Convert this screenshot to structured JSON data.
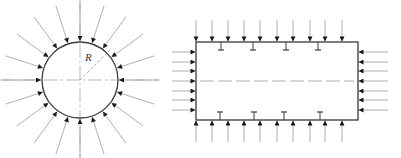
{
  "diagram": {
    "colors": {
      "outline": "#3a3a3a",
      "arrow_line": "#9a9a9a",
      "arrow_head": "#1a1a1a",
      "centerline": "#8a8a8a"
    },
    "circle_figure": {
      "label_radius": "R",
      "center": [
        80,
        80
      ],
      "radius": 38,
      "arrow_count": 20,
      "arrow_length": 40,
      "description": "Circular cross-section under uniform external radial pressure"
    },
    "rectangle_figure": {
      "x": 196,
      "y": 42,
      "width": 162,
      "height": 78,
      "top_arrows_x": [
        196,
        212,
        228,
        244,
        260,
        277,
        293,
        310,
        325,
        342
      ],
      "bottom_arrows_x": [
        196,
        212,
        228,
        244,
        260,
        277,
        293,
        310,
        325,
        342
      ],
      "side_arrows_y": [
        52,
        62,
        71,
        81,
        91,
        100,
        110
      ],
      "top_stiffeners_x": [
        221,
        253,
        286,
        318
      ],
      "bottom_stiffeners_x": [
        220,
        254,
        284,
        320
      ],
      "description": "Rectangular cross-section with stiffeners under uniform external pressure"
    }
  }
}
